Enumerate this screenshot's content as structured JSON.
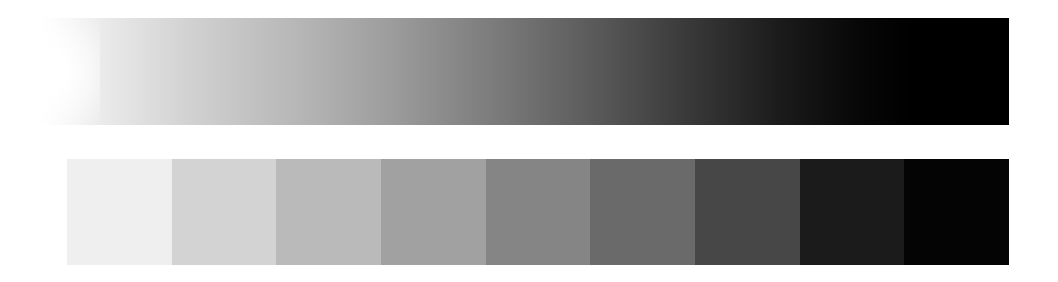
{
  "gradient": {
    "label": "continuous-grayscale-gradient",
    "start_color": "#ffffff",
    "end_color": "#000000"
  },
  "swatches": [
    {
      "color": "#efefef"
    },
    {
      "color": "#d3d3d3"
    },
    {
      "color": "#bababa"
    },
    {
      "color": "#a1a1a1"
    },
    {
      "color": "#858585"
    },
    {
      "color": "#6a6a6a"
    },
    {
      "color": "#474747"
    },
    {
      "color": "#1b1b1b"
    },
    {
      "color": "#040404"
    }
  ]
}
